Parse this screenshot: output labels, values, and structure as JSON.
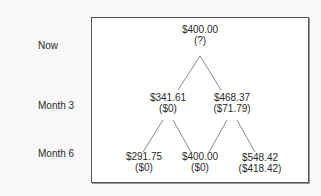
{
  "row_labels": [
    "Now",
    "Month 3",
    "Month 6"
  ],
  "nodes": {
    "root": {
      "price": "$400.00",
      "value": "(?)"
    },
    "m3_down": {
      "price": "$341.61",
      "value": "($0)"
    },
    "m3_up": {
      "price": "$468.37",
      "value": "($71.79)"
    },
    "m6_dd": {
      "price": "$291.75",
      "value": "($0)"
    },
    "m6_ud": {
      "price": "$400.00",
      "value": "($0)"
    },
    "m6_uu": {
      "price": "$548.42",
      "value": "($418.42)"
    }
  },
  "colors": {
    "line": "#7a7a7a",
    "border": "#555555"
  }
}
